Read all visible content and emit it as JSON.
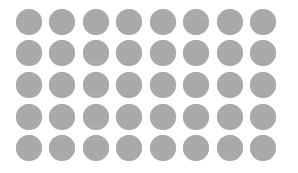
{
  "grid": {
    "rows": 5,
    "cols": 8,
    "dot_color": "#a7a7a7",
    "background": "#ffffff",
    "dot_diameter": 26,
    "col_centers": [
      29,
      62,
      96,
      129,
      163,
      196,
      230,
      263
    ],
    "row_centers": [
      22,
      53,
      85,
      117,
      148
    ]
  }
}
